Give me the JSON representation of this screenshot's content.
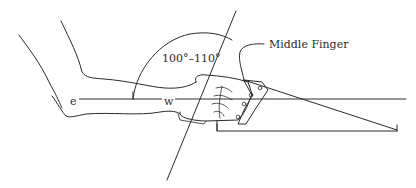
{
  "figure": {
    "type": "anatomical-diagram",
    "labels": {
      "angle": "100°–110°",
      "pointer": "Middle Finger",
      "elbow_point": "e",
      "wrist_point": "w"
    },
    "colors": {
      "line": "#2b2b2b",
      "background": "#ffffff"
    }
  }
}
